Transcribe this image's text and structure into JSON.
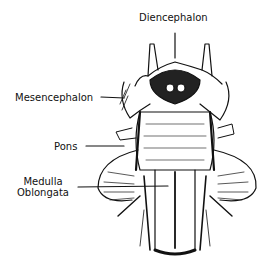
{
  "diagram": {
    "type": "anatomical illustration",
    "labels": [
      {
        "id": "diencephalon",
        "text": "Diencephalon"
      },
      {
        "id": "mesencephalon",
        "text": "Mesencephalon"
      },
      {
        "id": "pons",
        "text": "Pons"
      },
      {
        "id": "medulla",
        "line1": "Medulla",
        "line2": "Oblongata"
      }
    ]
  }
}
